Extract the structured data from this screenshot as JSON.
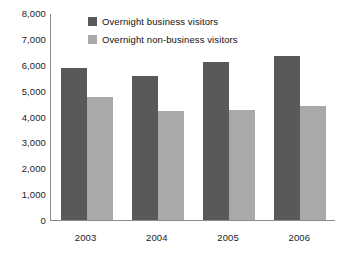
{
  "chart_data": {
    "type": "bar",
    "title": "",
    "subtitle": "",
    "xlabel": "",
    "ylabel": "",
    "categories": [
      "2003",
      "2004",
      "2005",
      "2006"
    ],
    "series": [
      {
        "name": "Overnight business visitors",
        "color": "#595959",
        "values": [
          5870,
          5550,
          6120,
          6350
        ]
      },
      {
        "name": "Overnight non-business visitors",
        "color": "#a9a9a9",
        "values": [
          4770,
          4200,
          4270,
          4390
        ]
      }
    ],
    "ylim": [
      0,
      8000
    ],
    "y_ticks": [
      0,
      1000,
      2000,
      3000,
      4000,
      5000,
      6000,
      7000,
      8000
    ],
    "y_tick_labels": [
      "0",
      "1,000",
      "2,000",
      "3,000",
      "4,000",
      "5,000",
      "6,000",
      "7,000",
      "8,000"
    ],
    "grid": false,
    "legend_position": "top-center",
    "annotations": []
  },
  "legend": {
    "items": [
      {
        "label": "Overnight business visitors",
        "swatch": "legend-swatch-business"
      },
      {
        "label": "Overnight non-business visitors",
        "swatch": "legend-swatch-nonbusiness"
      }
    ]
  },
  "colors": {
    "business": "#595959",
    "nonbusiness": "#a9a9a9",
    "axis": "#8c8c8c",
    "text": "#1b1b1b",
    "background": "#ffffff"
  }
}
